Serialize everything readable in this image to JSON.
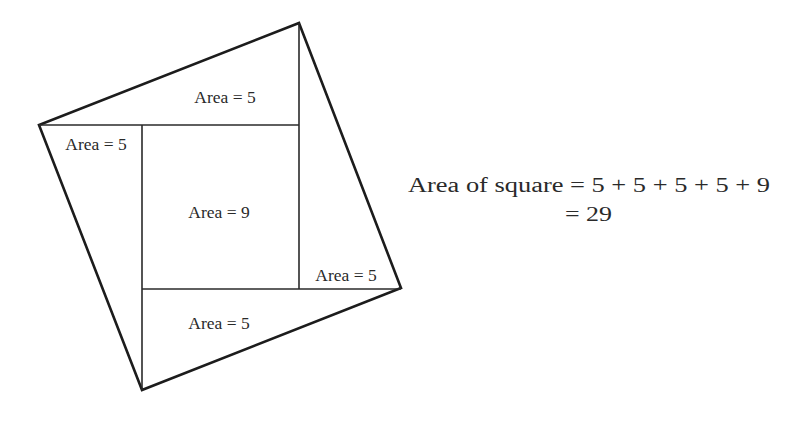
{
  "diagram": {
    "outer_square": {
      "vertices": [
        [
          299,
          23
        ],
        [
          401,
          288
        ],
        [
          142,
          390
        ],
        [
          39,
          125
        ]
      ]
    },
    "inner_lines": [
      {
        "x1": 39,
        "y1": 125,
        "x2": 299,
        "y2": 125
      },
      {
        "x1": 299,
        "y1": 23,
        "x2": 299,
        "y2": 289
      },
      {
        "x1": 142,
        "y1": 289,
        "x2": 401,
        "y2": 289
      },
      {
        "x1": 142,
        "y1": 125,
        "x2": 142,
        "y2": 390
      }
    ],
    "regions": [
      {
        "name": "top-triangle",
        "label": "Area = 5",
        "x": 225,
        "y": 103
      },
      {
        "name": "left-triangle",
        "label": "Area = 5",
        "x": 96,
        "y": 150
      },
      {
        "name": "center-square",
        "label": "Area = 9",
        "x": 219,
        "y": 218
      },
      {
        "name": "right-triangle",
        "label": "Area = 5",
        "x": 346,
        "y": 281
      },
      {
        "name": "bottom-triangle",
        "label": "Area = 5",
        "x": 219,
        "y": 329
      }
    ]
  },
  "equation": {
    "line1": "Area of square = 5 + 5 + 5 + 5 + 9",
    "line2": "= 29"
  },
  "colors": {
    "line": "#1c1c1c",
    "text": "#2a2a2a",
    "background": "#ffffff"
  }
}
